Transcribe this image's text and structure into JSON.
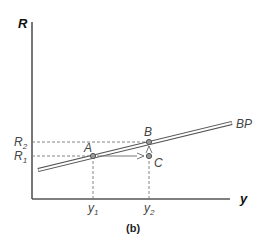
{
  "diagram": {
    "caption": "(b)",
    "axes": {
      "y_label": "R",
      "x_label": "y"
    },
    "curve": {
      "label": "BP"
    },
    "points": {
      "A": "A",
      "B": "B",
      "C": "C"
    },
    "y_ticks": {
      "R1_main": "R",
      "R1_sub": "1",
      "R2_main": "R",
      "R2_sub": "2"
    },
    "x_ticks": {
      "y1_main": "y",
      "y1_sub": "1",
      "y2_main": "y",
      "y2_sub": "2"
    },
    "colors": {
      "axis": "#555555",
      "line": "#555555",
      "point_fill": "#9a9a9a",
      "text": "#4a4a4a"
    }
  }
}
